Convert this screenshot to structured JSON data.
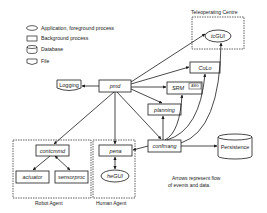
{
  "legend": {
    "items": [
      {
        "shape": "ellipse",
        "label": "Application, foreground process"
      },
      {
        "shape": "rectangle",
        "label": "Background process"
      },
      {
        "shape": "cylinder",
        "label": "Database"
      },
      {
        "shape": "document",
        "label": "File"
      }
    ]
  },
  "groups": {
    "teleoperating": "Teleoperating Centre",
    "robot": "Robot Agent",
    "human": "Human Agent"
  },
  "nodes": {
    "tcgui": "tcGUI",
    "logging": "Logging",
    "pmd": "pmd",
    "colo": "CoLo",
    "srm": "SRM",
    "srm_tag": "AMG",
    "planning": "planning",
    "contcmmd": "contcmmd",
    "actuator": "actuator",
    "sensorproc": "sensorproc",
    "pena": "pena",
    "hegui": "heGUI",
    "confmang": "confmang",
    "persistence": "Persistence"
  },
  "note": {
    "line1": "Arrows represent flow",
    "line2": "of events and data."
  },
  "colors": {
    "stroke": "#1a1a1a",
    "background": "#ffffff"
  }
}
